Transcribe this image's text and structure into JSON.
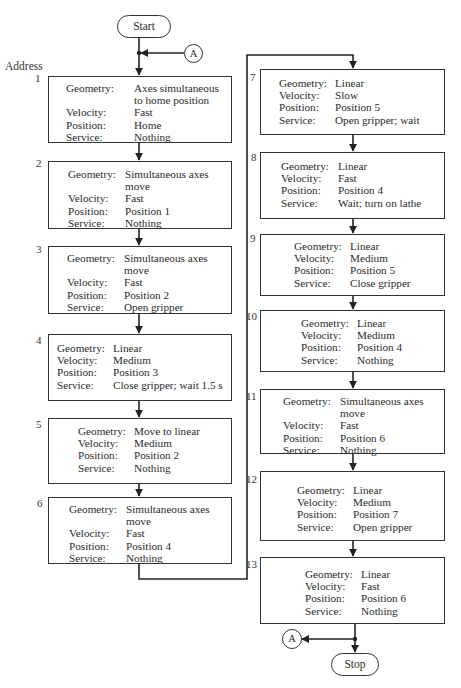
{
  "header": {
    "address_label": "Address"
  },
  "terminals": {
    "start": "Start",
    "stop": "Stop"
  },
  "connectors": {
    "top": "A",
    "bottom": "A"
  },
  "field_labels": {
    "geometry": "Geometry:",
    "velocity": "Velocity:",
    "position": "Position:",
    "service": "Service:"
  },
  "steps": [
    {
      "address": "1",
      "geometry": [
        "Axes simultaneous",
        "to home position"
      ],
      "velocity": "Fast",
      "position": "Home",
      "service": "Nothing"
    },
    {
      "address": "2",
      "geometry": [
        "Simultaneous axes",
        "move"
      ],
      "velocity": "Fast",
      "position": "Position 1",
      "service": "Nothing"
    },
    {
      "address": "3",
      "geometry": [
        "Simultaneous axes",
        "move"
      ],
      "velocity": "Fast",
      "position": "Position 2",
      "service": "Open gripper"
    },
    {
      "address": "4",
      "geometry": [
        "Linear"
      ],
      "velocity": "Medium",
      "position": "Position 3",
      "service": "Close gripper; wait 1.5 s"
    },
    {
      "address": "5",
      "geometry": [
        "Move to linear"
      ],
      "velocity": "Medium",
      "position": "Position 2",
      "service": "Nothing"
    },
    {
      "address": "6",
      "geometry": [
        "Simultaneous axes",
        "move"
      ],
      "velocity": "Fast",
      "position": "Position 4",
      "service": "Nothing"
    },
    {
      "address": "7",
      "geometry": [
        "Linear"
      ],
      "velocity": "Slow",
      "position": "Position 5",
      "service": "Open gripper; wait"
    },
    {
      "address": "8",
      "geometry": [
        "Linear"
      ],
      "velocity": "Fast",
      "position": "Position 4",
      "service": "Wait; turn on lathe"
    },
    {
      "address": "9",
      "geometry": [
        "Linear"
      ],
      "velocity": "Medium",
      "position": "Position 5",
      "service": "Close gripper"
    },
    {
      "address": "10",
      "geometry": [
        "Linear"
      ],
      "velocity": "Medium",
      "position": "Position 4",
      "service": "Nothing"
    },
    {
      "address": "11",
      "geometry": [
        "Simultaneous axes",
        "move"
      ],
      "velocity": "Fast",
      "position": "Position 6",
      "service": "Nothing"
    },
    {
      "address": "12",
      "geometry": [
        "Linear"
      ],
      "velocity": "Medium",
      "position": "Position 7",
      "service": "Open gripper"
    },
    {
      "address": "13",
      "geometry": [
        "Linear"
      ],
      "velocity": "Fast",
      "position": "Position 6",
      "service": "Nothing"
    }
  ],
  "colors": {
    "line": "#222222",
    "text": "#2a2a2a",
    "background": "#ffffff"
  }
}
